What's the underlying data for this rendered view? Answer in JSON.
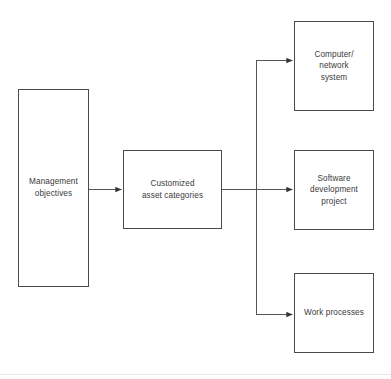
{
  "diagram": {
    "type": "flowchart",
    "orientation": "left-to-right",
    "background_color": "#ffffff",
    "stroke_color": "#4a4a4a",
    "text_color": "#3a3a3a",
    "nodes": [
      {
        "id": "management-objectives",
        "label": "Management\nobjectives",
        "shape": "rectangle",
        "column": 1
      },
      {
        "id": "customized-asset-categories",
        "label": "Customized\nasset categories",
        "shape": "rectangle",
        "column": 2
      },
      {
        "id": "computer-network-system",
        "label": "Computer/\nnetwork\nsystem",
        "shape": "rectangle",
        "column": 3
      },
      {
        "id": "software-development-project",
        "label": "Software\ndevelopment\nproject",
        "shape": "rectangle",
        "column": 3
      },
      {
        "id": "work-processes",
        "label": "Work processes",
        "shape": "rectangle",
        "column": 3
      }
    ],
    "edges": [
      {
        "id": "edge-objectives-to-categories",
        "from": "management-objectives",
        "to": "customized-asset-categories",
        "style": "straight",
        "arrowhead": "filled-triangle"
      },
      {
        "id": "edge-categories-to-software",
        "from": "customized-asset-categories",
        "to": "software-development-project",
        "style": "straight",
        "arrowhead": "filled-triangle"
      },
      {
        "id": "edge-categories-to-computer",
        "from": "customized-asset-categories",
        "to": "computer-network-system",
        "style": "orthogonal-branch",
        "arrowhead": "filled-triangle"
      },
      {
        "id": "edge-categories-to-work",
        "from": "customized-asset-categories",
        "to": "work-processes",
        "style": "orthogonal-branch",
        "arrowhead": "filled-triangle"
      }
    ]
  }
}
